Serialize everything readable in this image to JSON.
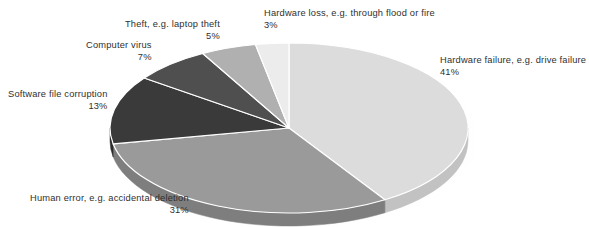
{
  "chart_data": {
    "type": "pie",
    "title": "",
    "subtitle": "",
    "xlabel": "",
    "ylabel": "",
    "legend_position": "none",
    "grid": false,
    "value_unit": "%",
    "categories": [
      "Hardware failure, e.g. drive failure",
      "Human error, e.g. accidental deletion",
      "Software file corruption",
      "Computer virus",
      "Theft, e.g. laptop theft",
      "Hardware loss, e.g. through flood or fire"
    ],
    "values": [
      41,
      31,
      13,
      7,
      5,
      3
    ],
    "slices": [
      {
        "key": "hardware-failure",
        "label": "Hardware failure, e.g. drive failure",
        "value": 41,
        "value_text": "41%",
        "color": "#dcdcdc",
        "side_color": "#c2c2c2"
      },
      {
        "key": "human-error",
        "label": "Human error, e.g. accidental deletion",
        "value": 31,
        "value_text": "31%",
        "color": "#9a9a9a",
        "side_color": "#7e7e7e"
      },
      {
        "key": "software-file-corruption",
        "label": "Software file corruption",
        "value": 13,
        "value_text": "13%",
        "color": "#3a3a3a",
        "side_color": "#2b2b2b"
      },
      {
        "key": "computer-virus",
        "label": "Computer virus",
        "value": 7,
        "value_text": "7%",
        "color": "#4f4f4f",
        "side_color": "#3d3d3d"
      },
      {
        "key": "theft",
        "label": "Theft, e.g. laptop theft",
        "value": 5,
        "value_text": "5%",
        "color": "#b0b0b0",
        "side_color": "#949494"
      },
      {
        "key": "hardware-loss",
        "label": "Hardware loss, e.g. through flood or fire",
        "value": 3,
        "value_text": "3%",
        "color": "#ececec",
        "side_color": "#d2d2d2"
      }
    ]
  },
  "colors": {
    "background": "#ffffff",
    "label_text": "#2f2f2f",
    "slice_edge": "#ffffff",
    "shadow": "#e9e9e9"
  }
}
